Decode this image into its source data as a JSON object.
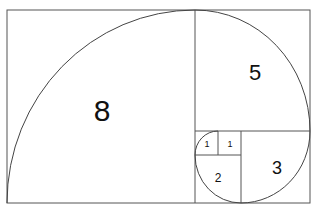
{
  "diagram": {
    "title": "",
    "type": "fibonacci-spiral",
    "squares": [
      {
        "label": "8",
        "x": 7,
        "y": 10,
        "size": 188,
        "font_size": 30,
        "lx": 102,
        "ly": 110
      },
      {
        "label": "5",
        "x": 195,
        "y": 10,
        "size": 115,
        "font_size": 22,
        "lx": 255,
        "ly": 72
      },
      {
        "label": "3",
        "x": 241,
        "y": 131,
        "size": 69,
        "font_size": 18,
        "lx": 277,
        "ly": 168
      },
      {
        "label": "2",
        "x": 195,
        "y": 155,
        "size": 46,
        "font_size": 12,
        "lx": 218,
        "ly": 178
      },
      {
        "label": "1",
        "x": 195,
        "y": 131,
        "size": 23,
        "font_size": 9,
        "lx": 207,
        "ly": 144
      },
      {
        "label": "1",
        "x": 218,
        "y": 131,
        "size": 23,
        "font_size": 9,
        "lx": 230,
        "ly": 144
      }
    ],
    "colors": {
      "line": "#555555",
      "text": "#111111",
      "background": "#ffffff"
    }
  }
}
